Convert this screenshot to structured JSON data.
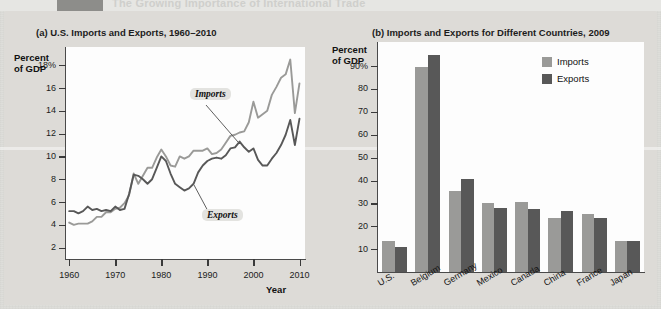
{
  "banner": {
    "tab_label": "",
    "title": "The Growing Importance of International Trade"
  },
  "colors": {
    "imports": "#9a9a98",
    "exports": "#585858",
    "plot_bg": "#fdfdfd",
    "page_bg": "#dcdcd8",
    "axis": "#3a3a3a"
  },
  "panel_a": {
    "title": "(a) U.S. Imports and Exports, 1960–2010",
    "y_axis_title": "Percent\nof GDP",
    "y_axis_title_line1": "Percent",
    "y_axis_title_line2": "of GDP",
    "x_axis_title": "Year",
    "callout_imports": "Imports",
    "callout_exports": "Exports"
  },
  "panel_b": {
    "title": "(b) Imports and Exports for Different Countries, 2009",
    "y_axis_title_line1": "Percent",
    "y_axis_title_line2": "of GDP",
    "legend": [
      {
        "label": "Imports",
        "color": "#9a9a98"
      },
      {
        "label": "Exports",
        "color": "#585858"
      }
    ]
  },
  "chart_data": [
    {
      "type": "line",
      "title": "(a) U.S. Imports and Exports, 1960–2010",
      "xlabel": "Year",
      "ylabel": "Percent of GDP",
      "xlim": [
        1960,
        2011
      ],
      "ylim": [
        2,
        19
      ],
      "grid": false,
      "x_ticks": [
        "1960",
        "1970",
        "1980",
        "1990",
        "2000",
        "2010"
      ],
      "x_tick_values": [
        1960,
        1970,
        1980,
        1990,
        2000,
        2010
      ],
      "y_ticks": [
        "2",
        "4",
        "6",
        "8",
        "10",
        "12",
        "14",
        "16",
        "18%"
      ],
      "y_tick_values": [
        2,
        4,
        6,
        8,
        10,
        12,
        14,
        16,
        18
      ],
      "legend_position": "inline-callouts",
      "series": [
        {
          "name": "Imports",
          "color": "#9a9a98",
          "x": [
            1960,
            1961,
            1962,
            1963,
            1964,
            1965,
            1966,
            1967,
            1968,
            1969,
            1970,
            1971,
            1972,
            1973,
            1974,
            1975,
            1976,
            1977,
            1978,
            1979,
            1980,
            1981,
            1982,
            1983,
            1984,
            1985,
            1986,
            1987,
            1988,
            1989,
            1990,
            1991,
            1992,
            1993,
            1994,
            1995,
            1996,
            1997,
            1998,
            1999,
            2000,
            2001,
            2002,
            2003,
            2004,
            2005,
            2006,
            2007,
            2008,
            2009,
            2010
          ],
          "values": [
            4.2,
            4.0,
            4.1,
            4.1,
            4.1,
            4.3,
            4.7,
            4.7,
            5.1,
            5.1,
            5.4,
            5.5,
            5.9,
            6.6,
            8.5,
            7.6,
            8.3,
            9.0,
            9.0,
            9.9,
            10.6,
            10.0,
            9.2,
            9.1,
            10.0,
            9.8,
            10.0,
            10.5,
            10.5,
            10.5,
            10.7,
            10.2,
            10.3,
            10.6,
            11.2,
            11.8,
            11.9,
            12.1,
            12.2,
            13.0,
            14.8,
            13.4,
            13.7,
            14.0,
            15.4,
            16.1,
            16.9,
            17.2,
            18.5,
            13.8,
            16.4
          ]
        },
        {
          "name": "Exports",
          "color": "#585858",
          "x": [
            1960,
            1961,
            1962,
            1963,
            1964,
            1965,
            1966,
            1967,
            1968,
            1969,
            1970,
            1971,
            1972,
            1973,
            1974,
            1975,
            1976,
            1977,
            1978,
            1979,
            1980,
            1981,
            1982,
            1983,
            1984,
            1985,
            1986,
            1987,
            1988,
            1989,
            1990,
            1991,
            1992,
            1993,
            1994,
            1995,
            1996,
            1997,
            1998,
            1999,
            2000,
            2001,
            2002,
            2003,
            2004,
            2005,
            2006,
            2007,
            2008,
            2009,
            2010
          ],
          "values": [
            5.2,
            5.2,
            5.0,
            5.2,
            5.6,
            5.3,
            5.4,
            5.2,
            5.3,
            5.2,
            5.6,
            5.3,
            5.4,
            6.7,
            8.4,
            8.3,
            8.0,
            7.6,
            8.0,
            9.0,
            10.0,
            9.6,
            8.5,
            7.6,
            7.3,
            7.0,
            7.2,
            7.6,
            8.6,
            9.2,
            9.6,
            9.8,
            9.9,
            9.8,
            10.1,
            10.7,
            10.8,
            11.3,
            10.8,
            10.4,
            10.7,
            9.7,
            9.2,
            9.2,
            9.8,
            10.3,
            11.0,
            11.9,
            13.2,
            11.0,
            13.3
          ]
        }
      ]
    },
    {
      "type": "bar",
      "title": "(b) Imports and Exports for Different Countries, 2009",
      "xlabel": "",
      "ylabel": "Percent of GDP",
      "ylim": [
        0,
        98
      ],
      "grid": false,
      "y_ticks": [
        "10",
        "20",
        "30",
        "40",
        "50",
        "60",
        "70",
        "80",
        "90%"
      ],
      "y_tick_values": [
        10,
        20,
        30,
        40,
        50,
        60,
        70,
        80,
        90
      ],
      "categories": [
        "U.S.",
        "Belgium",
        "Germany",
        "Mexico",
        "Canada",
        "China",
        "France",
        "Japan"
      ],
      "legend_position": "top-right",
      "series": [
        {
          "name": "Imports",
          "color": "#9a9a98",
          "values": [
            13.5,
            89.5,
            35.5,
            30.0,
            30.5,
            23.5,
            25.5,
            13.5
          ]
        },
        {
          "name": "Exports",
          "color": "#585858",
          "values": [
            11.0,
            95.0,
            40.5,
            28.0,
            27.5,
            26.5,
            23.5,
            13.5
          ]
        }
      ]
    }
  ]
}
